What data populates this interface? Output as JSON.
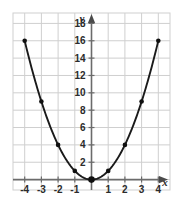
{
  "chart_data": {
    "type": "line",
    "title": "",
    "subtitle": "",
    "xlabel": "x",
    "ylabel": "y",
    "xlim": [
      -4.7,
      4.7
    ],
    "ylim": [
      -1.2,
      19.2
    ],
    "grid": true,
    "legend": false,
    "legend_position": "none",
    "equation": "y = x^2",
    "x_ticks": [
      -4,
      -3,
      -2,
      -1,
      1,
      2,
      3,
      4
    ],
    "x_tick_labels": [
      "-4",
      "-3",
      "-2",
      "-1",
      "1",
      "2",
      "3",
      "4"
    ],
    "y_ticks": [
      2,
      4,
      6,
      8,
      10,
      12,
      14,
      16,
      18
    ],
    "y_tick_labels": [
      "2",
      "4",
      "6",
      "8",
      "10",
      "12",
      "14",
      "16",
      "18"
    ],
    "x_gridline_step": 1,
    "y_gridline_step": 2,
    "series": [
      {
        "name": "y = x^2",
        "x": [
          -4,
          -3,
          -2,
          -1,
          0,
          1,
          2,
          3,
          4
        ],
        "values": [
          16,
          9,
          4,
          1,
          0,
          1,
          4,
          9,
          16
        ],
        "marker": "filled-circle",
        "color": "#1a1a1a"
      }
    ],
    "vertex": {
      "x": 0,
      "y": 0,
      "emphasized": true
    },
    "colors": {
      "curve": "#1a1a1a",
      "marker": "#101010",
      "axis": "#6b6b6b",
      "gridline": "#cfcfcf",
      "text": "#2b2b2b",
      "background": "#ffffff"
    }
  },
  "axes": {
    "y_axis_label": "y",
    "x_axis_label": "x"
  }
}
